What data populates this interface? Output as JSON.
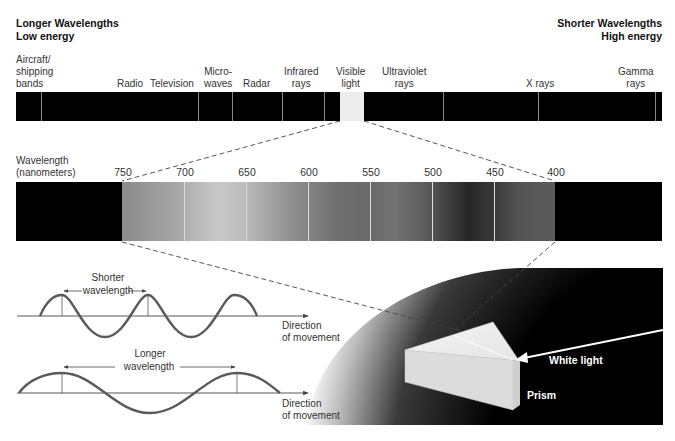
{
  "header": {
    "left": {
      "line1": "Longer Wavelengths",
      "line2": "Low energy"
    },
    "right": {
      "line1": "Shorter Wavelengths",
      "line2": "High energy"
    }
  },
  "em_spectrum": {
    "bands": [
      {
        "id": "aircraft",
        "lines": [
          "Aircraft/",
          "shipping",
          "bands"
        ]
      },
      {
        "id": "radio",
        "lines": [
          "Radio"
        ]
      },
      {
        "id": "television",
        "lines": [
          "Television"
        ]
      },
      {
        "id": "microwaves",
        "lines": [
          "Micro-",
          "waves"
        ]
      },
      {
        "id": "radar",
        "lines": [
          "Radar"
        ]
      },
      {
        "id": "infrared",
        "lines": [
          "Infrared",
          "rays"
        ]
      },
      {
        "id": "visible",
        "lines": [
          "Visible",
          "light"
        ]
      },
      {
        "id": "ultraviolet",
        "lines": [
          "Ultraviolet",
          "rays"
        ]
      },
      {
        "id": "xrays",
        "lines": [
          "X rays"
        ]
      },
      {
        "id": "gamma",
        "lines": [
          "Gamma",
          "rays"
        ]
      }
    ]
  },
  "visible_spectrum": {
    "axis_label": {
      "line1": "Wavelength",
      "line2": "(nanometers)"
    },
    "ticks": [
      "750",
      "700",
      "650",
      "600",
      "550",
      "500",
      "450",
      "400"
    ]
  },
  "waves": {
    "short": {
      "label_line1": "Shorter",
      "label_line2": "wavelength",
      "direction_line1": "Direction",
      "direction_line2": "of movement"
    },
    "long": {
      "label_line1": "Longer",
      "label_line2": "wavelength",
      "direction_line1": "Direction",
      "direction_line2": "of movement"
    }
  },
  "prism": {
    "white_light_label": "White light",
    "prism_label": "Prism"
  },
  "colors": {
    "bar": "#000000",
    "visible_box": "#ececec",
    "wave_stroke": "#555555",
    "dashes": "#444444"
  }
}
